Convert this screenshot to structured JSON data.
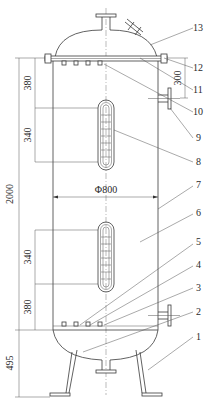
{
  "diagram": {
    "type": "vessel-engineering-drawing",
    "dimensions": {
      "overall_height": "2000",
      "top_to_upper_distributor": "380",
      "upper_distributor_length": "340",
      "lower_distributor_length": "340",
      "lower_distributor_to_bottom": "380",
      "leg_height": "495",
      "nozzle_offset": "300",
      "diameter": "Φ800"
    },
    "callouts": [
      "1",
      "2",
      "3",
      "4",
      "5",
      "6",
      "7",
      "8",
      "9",
      "10",
      "11",
      "12",
      "13"
    ]
  }
}
